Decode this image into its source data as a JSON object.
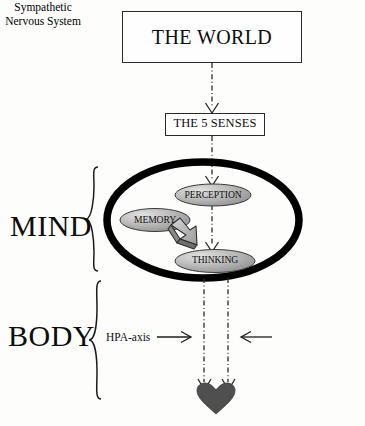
{
  "diagram": {
    "background_color": "#fdfdfc",
    "ink_color": "#0d0d0d",
    "nodes": {
      "world": {
        "label": "THE WORLD",
        "shape": "rectangle"
      },
      "senses": {
        "label": "THE 5 SENSES",
        "shape": "rectangle"
      },
      "mind_region": {
        "label": "MIND",
        "shape": "brace-group"
      },
      "body_region": {
        "label": "BODY",
        "shape": "brace-group"
      },
      "perception": {
        "label": "PERCEPTION",
        "shape": "ellipse",
        "fill": "#a9a9a9"
      },
      "memory": {
        "label": "MEMORY",
        "shape": "ellipse",
        "fill": "#a9a9a9"
      },
      "thinking": {
        "label": "THINKING",
        "shape": "ellipse",
        "fill": "#a9a9a9"
      },
      "heart": {
        "label": "heart",
        "shape": "heart",
        "fill": "#4d4d4d"
      }
    },
    "annotations": {
      "hpa_axis": "HPA-axis",
      "sympathetic_nervous_system": "Sympathetic\nNervous System",
      "sympathetic_line_1": "Sympathetic",
      "sympathetic_line_2": "Nervous System"
    },
    "edges": [
      {
        "from": "world",
        "to": "senses",
        "style": "dash-dot",
        "arrow": "down"
      },
      {
        "from": "senses",
        "to": "perception",
        "style": "dash-dot",
        "arrow": "down"
      },
      {
        "from": "perception",
        "to": "thinking",
        "style": "dash-dot",
        "arrow": "down"
      },
      {
        "from": "memory",
        "to": "thinking",
        "style": "block-arrow-3d",
        "arrow": "down-right"
      },
      {
        "from": "mind_region",
        "to": "heart",
        "style": "dash-dot",
        "arrow": "down",
        "count": 2
      },
      {
        "from": "hpa_axis",
        "to": "left-channel",
        "style": "solid",
        "arrow": "right"
      },
      {
        "from": "sympathetic_nervous_system",
        "to": "right-channel",
        "style": "solid",
        "arrow": "left"
      }
    ]
  }
}
